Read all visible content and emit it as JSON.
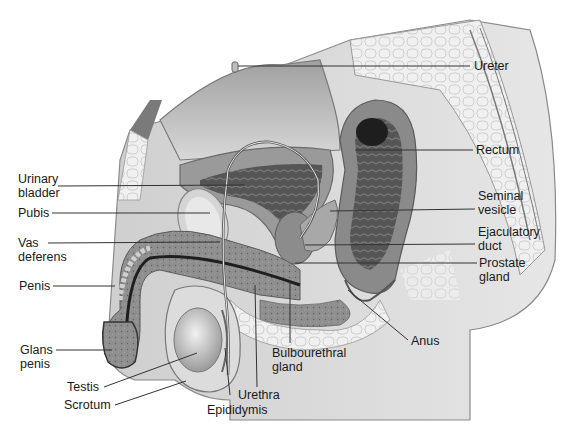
{
  "diagram": {
    "colors": {
      "skin": "#d9d9d9",
      "skin_edge": "#8a8a8a",
      "bone_spongy": "#e6e6e6",
      "bladder_wall": "#9a9a9a",
      "bladder_lumen": "#4a4a4a",
      "rectum_dark": "#3a3a3a",
      "duct": "#2a2a2a",
      "leader_line": "#333333"
    }
  },
  "labels": {
    "ureter": "Ureter",
    "rectum": "Rectum",
    "urinary_bladder": "Urinary\nbladder",
    "seminal_vesicle": "Seminal\nvesicle",
    "pubis": "Pubis",
    "ejaculatory_duct": "Ejaculatory\nduct",
    "vas_deferens": "Vas\ndeferens",
    "prostate_gland": "Prostate\ngland",
    "penis": "Penis",
    "anus": "Anus",
    "glans_penis": "Glans\npenis",
    "bulbourethral_gland": "Bulbourethral\ngland",
    "testis": "Testis",
    "urethra": "Urethra",
    "scrotum": "Scrotum",
    "epididymis": "Epididymis"
  }
}
